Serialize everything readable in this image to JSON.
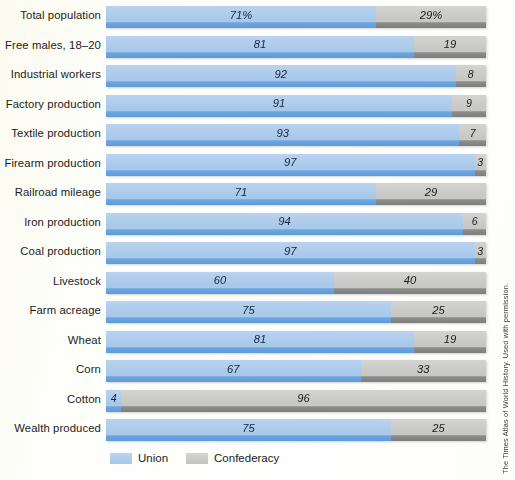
{
  "chart_data": {
    "type": "bar",
    "title": "",
    "subtitle": "",
    "xlabel": "",
    "ylabel": "",
    "xlim": [
      0,
      100
    ],
    "grid": false,
    "orientation": "horizontal",
    "stacked": true,
    "units": "percent",
    "legend_position": "bottom",
    "categories": [
      "Total population",
      "Free males, 18–20",
      "Industrial workers",
      "Factory production",
      "Textile production",
      "Firearm production",
      "Railroad mileage",
      "Iron production",
      "Coal production",
      "Livestock",
      "Farm acreage",
      "Wheat",
      "Corn",
      "Cotton",
      "Wealth produced"
    ],
    "series": [
      {
        "name": "Union",
        "color": "#aeccec",
        "values": [
          71,
          81,
          92,
          91,
          93,
          97,
          71,
          94,
          97,
          60,
          75,
          81,
          67,
          4,
          75
        ],
        "labels": [
          "71%",
          "81",
          "92",
          "91",
          "93",
          "97",
          "71",
          "94",
          "97",
          "60",
          "75",
          "81",
          "67",
          "4",
          "75"
        ]
      },
      {
        "name": "Confederacy",
        "color": "#c7c7c5",
        "values": [
          29,
          19,
          8,
          9,
          7,
          3,
          29,
          6,
          3,
          40,
          25,
          19,
          33,
          96,
          25
        ],
        "labels": [
          "29%",
          "19",
          "8",
          "9",
          "7",
          "3",
          "29",
          "6",
          "3",
          "40",
          "25",
          "19",
          "33",
          "96",
          "25"
        ]
      }
    ]
  },
  "legend": {
    "items": [
      {
        "label": "Union",
        "color": "#aeccec"
      },
      {
        "label": "Confederacy",
        "color": "#c7c7c5"
      }
    ]
  },
  "credit": {
    "text": "The Times Atlas of World History. Used with permission."
  }
}
